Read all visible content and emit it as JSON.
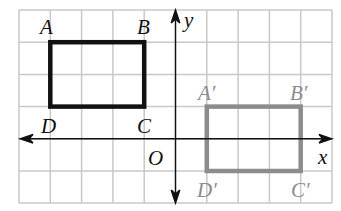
{
  "grid": {
    "x0": 19,
    "y0": 10,
    "cols": 10,
    "rows": 6,
    "cell_w": 31.3,
    "cell_h": 32.2,
    "color": "#c8c8c8"
  },
  "axes": {
    "x_label": "x",
    "y_label": "y",
    "origin_label": "O",
    "color": "#111111"
  },
  "original": {
    "name": "ABCD",
    "color": "#111111",
    "vertices": {
      "A": [
        -4,
        3
      ],
      "B": [
        -1,
        3
      ],
      "C": [
        -1,
        1
      ],
      "D": [
        -4,
        1
      ]
    },
    "labels": {
      "A": "A",
      "B": "B",
      "C": "C",
      "D": "D"
    }
  },
  "image": {
    "name": "A'B'C'D'",
    "color": "#8c8c8c",
    "vertices": {
      "A'": [
        1,
        1
      ],
      "B'": [
        4,
        1
      ],
      "C'": [
        4,
        -1
      ],
      "D'": [
        1,
        -1
      ]
    },
    "labels": {
      "A": "A′",
      "B": "B′",
      "C": "C′",
      "D": "D′"
    }
  }
}
